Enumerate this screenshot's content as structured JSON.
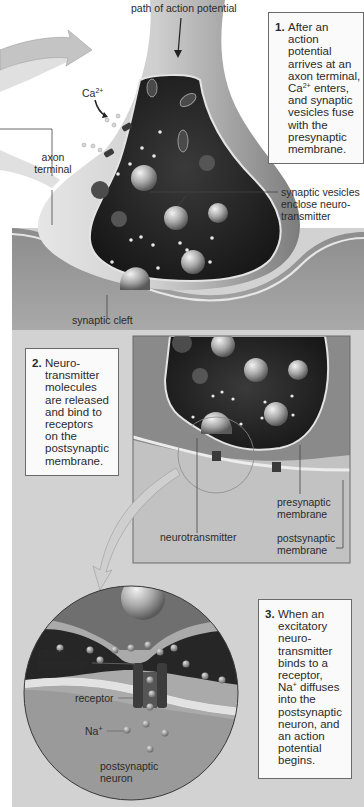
{
  "figure": {
    "colors": {
      "panel_bg": "#d2d2d2",
      "axon_light": "#d6d6d6",
      "axon_mid": "#8e8e8e",
      "cytoplasm": "#262626",
      "membrane": "#e8e8e8",
      "postsynaptic": "#8a8a8a",
      "box_bg": "#fafafa",
      "box_border": "#6a6a6a",
      "text": "#2a2a2a"
    }
  },
  "labels": {
    "path_of_action_potential": "path of action potential",
    "ca": "Ca",
    "ca_sup": "2+",
    "axon_terminal_line1": "axon",
    "axon_terminal_line2": "terminal",
    "synaptic_vesicles_line1": "synaptic vesicles",
    "synaptic_vesicles_line2": "enclose neuro-",
    "synaptic_vesicles_line3": "transmitter",
    "synaptic_cleft": "synaptic cleft",
    "neurotransmitter": "neurotransmitter",
    "presynaptic_line1": "presynaptic",
    "presynaptic_line2": "membrane",
    "postsynaptic_line1": "postsynaptic",
    "postsynaptic_line2": "membrane",
    "nt_line1": "neuro-",
    "nt_line2": "transmitter",
    "receptor": "receptor",
    "na": "Na",
    "na_sup": "+",
    "postsynaptic_neuron_line1": "postsynaptic",
    "postsynaptic_neuron_line2": "neuron"
  },
  "steps": [
    {
      "number": "1.",
      "lines": [
        "After an",
        "action",
        "potential",
        "arrives at an",
        "axon terminal,",
        "Ca2+ enters,",
        "and synaptic",
        "vesicles fuse",
        "with the",
        "presynaptic",
        "membrane."
      ],
      "ca_line_prefix": "Ca",
      "ca_line_sup": "2+",
      "ca_line_suffix": " enters,"
    },
    {
      "number": "2.",
      "lines": [
        "Neuro-",
        "transmitter",
        "molecules",
        "are released",
        "and bind to",
        "receptors",
        "on the",
        "postsynaptic",
        "membrane."
      ]
    },
    {
      "number": "3.",
      "lines": [
        "When an",
        "excitatory",
        "neuro-",
        "transmitter",
        "binds to a",
        "receptor,",
        "Na+ diffuses",
        "into the",
        "postsynaptic",
        "neuron, and",
        "an action",
        "potential",
        "begins."
      ],
      "na_line_prefix": "Na",
      "na_line_sup": "+",
      "na_line_suffix": " diffuses"
    }
  ]
}
